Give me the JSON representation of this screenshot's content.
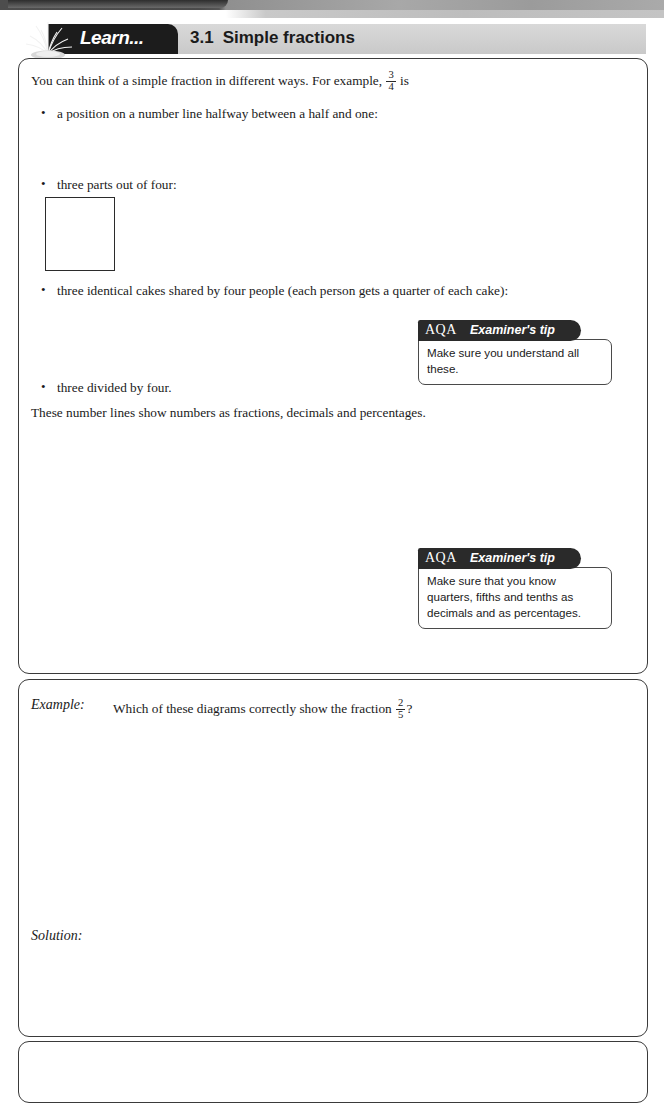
{
  "header": {
    "badge_label": "Learn...",
    "section_number": "3.1",
    "section_title": "Simple fractions",
    "plant_icon": "plant-icon"
  },
  "learn": {
    "intro": {
      "before": "You can think of a simple fraction in different ways. For example,",
      "fraction": {
        "numerator": "3",
        "denominator": "4"
      },
      "after": "is"
    },
    "bullets": [
      "a position on a number line halfway between a half and one:",
      "three parts out of four:",
      "three identical cakes shared by four people (each person gets a quarter of each cake):",
      "three divided by four."
    ],
    "numberline_top": {
      "labels": [
        "0",
        "1/4",
        "1/2",
        "3/4",
        "1"
      ],
      "fractions": [
        {
          "numerator": "",
          "denominator": "",
          "plain": "0"
        },
        {
          "numerator": "1",
          "denominator": "4",
          "plain": ""
        },
        {
          "numerator": "1",
          "denominator": "2",
          "plain": ""
        },
        {
          "numerator": "3",
          "denominator": "4",
          "plain": ""
        },
        {
          "numerator": "",
          "denominator": "",
          "plain": "1"
        }
      ]
    },
    "grid_three_quarters": {
      "rows": 2,
      "cols": 2,
      "shaded": [
        true,
        true,
        true,
        false
      ]
    },
    "cakes": [
      {
        "rows": 2,
        "cols": 2,
        "shaded": [
          true,
          false,
          false,
          false
        ]
      },
      {
        "rows": 2,
        "cols": 2,
        "shaded": [
          true,
          false,
          false,
          false
        ]
      },
      {
        "rows": 2,
        "cols": 2,
        "shaded": [
          true,
          false,
          false,
          false
        ]
      }
    ],
    "numberlines_intro": "These number lines show numbers as fractions, decimals and percentages.",
    "numberlines": [
      {
        "name": "quarters",
        "fractions": [
          "0",
          "1/4",
          "1/2",
          "3/4",
          "1"
        ],
        "fraction_parts": [
          {
            "plain": "0"
          },
          {
            "numerator": "1",
            "denominator": "4"
          },
          {
            "numerator": "1",
            "denominator": "2"
          },
          {
            "numerator": "3",
            "denominator": "4"
          },
          {
            "plain": "1"
          }
        ],
        "decimals": [
          "0",
          "0.25",
          "0.5",
          "0.75",
          "1"
        ],
        "percentages": [
          "0%",
          "25%",
          "50%",
          "75%",
          "100%"
        ]
      },
      {
        "name": "fifths",
        "fractions": [
          "0",
          "1/5",
          "2/5",
          "3/5",
          "4/5",
          "1"
        ],
        "fraction_parts": [
          {
            "plain": "0"
          },
          {
            "numerator": "1",
            "denominator": "5"
          },
          {
            "numerator": "2",
            "denominator": "5"
          },
          {
            "numerator": "3",
            "denominator": "5"
          },
          {
            "numerator": "4",
            "denominator": "5"
          },
          {
            "plain": "1"
          }
        ],
        "decimals": [
          "0",
          "0.2",
          "0.4",
          "0.6",
          "0.8",
          "1"
        ],
        "percentages": [
          "0%",
          "20%",
          "40%",
          "60%",
          "80%",
          "100%"
        ]
      },
      {
        "name": "tenths",
        "fractions": [
          "0",
          "1/10",
          "2/10",
          "3/10",
          "4/10",
          "5/10",
          "6/10",
          "7/10",
          "8/10",
          "9/10",
          "1"
        ],
        "fraction_parts": [
          {
            "plain": "0"
          },
          {
            "numerator": "1",
            "denominator": "10"
          },
          {
            "numerator": "2",
            "denominator": "10"
          },
          {
            "numerator": "3",
            "denominator": "10"
          },
          {
            "numerator": "4",
            "denominator": "10"
          },
          {
            "numerator": "5",
            "denominator": "10"
          },
          {
            "numerator": "6",
            "denominator": "10"
          },
          {
            "numerator": "7",
            "denominator": "10"
          },
          {
            "numerator": "8",
            "denominator": "10"
          },
          {
            "numerator": "9",
            "denominator": "10"
          },
          {
            "plain": "1"
          }
        ],
        "decimals": [
          "0",
          "0.1",
          "0.2",
          "0.3",
          "0.4",
          "0.5",
          "0.6",
          "0.7",
          "0.8",
          "0.9",
          "1"
        ],
        "percentages": [
          "0%",
          "10%",
          "20%",
          "30%",
          "40%",
          "50%",
          "60%",
          "70%",
          "80%",
          "90%",
          "100%"
        ]
      }
    ]
  },
  "tips": [
    {
      "brand": "AQA",
      "title": "Examiner's tip",
      "body": "Make sure you understand all these."
    },
    {
      "brand": "AQA",
      "title": "Examiner's tip",
      "body": "Make sure that you know quarters, fifths and tenths as decimals and as percentages."
    }
  ],
  "example": {
    "label": "Example:",
    "question_before": "Which of these diagrams correctly show the fraction",
    "question_fraction": {
      "numerator": "2",
      "denominator": "5"
    },
    "question_after": "?",
    "options": [
      {
        "letter": "a",
        "type": "bar",
        "segments": [
          {
            "width": 46,
            "shaded": false
          },
          {
            "width": 46,
            "shaded": false
          },
          {
            "width": 46,
            "shaded": false
          },
          {
            "width": 46,
            "shaded": true
          },
          {
            "width": 46,
            "shaded": true
          }
        ]
      },
      {
        "letter": "b",
        "type": "bar",
        "segments": [
          {
            "width": 47,
            "shaded": true
          },
          {
            "width": 47,
            "shaded": true
          },
          {
            "width": 31,
            "shaded": false
          },
          {
            "width": 31,
            "shaded": false
          },
          {
            "width": 31,
            "shaded": false
          }
        ]
      },
      {
        "letter": "c",
        "type": "bar",
        "segments": [
          {
            "width": 25,
            "shaded": true
          },
          {
            "width": 25,
            "shaded": true
          },
          {
            "width": 25,
            "shaded": false
          },
          {
            "width": 25,
            "shaded": false
          },
          {
            "width": 25,
            "shaded": false
          },
          {
            "width": 25,
            "shaded": false
          },
          {
            "width": 25,
            "shaded": false
          }
        ]
      },
      {
        "letter": "d",
        "type": "pentagon",
        "slices_total": 5,
        "slices_shaded": 2
      }
    ]
  },
  "solution": {
    "label": "Solution:",
    "items": [
      {
        "letter": "a",
        "text": "Correct: the bar is split into five equal pieces and two are shaded."
      },
      {
        "letter": "b",
        "text": "Incorrect: the bar is not split into equal pieces."
      },
      {
        "letter": "c",
        "text": "Incorrect: the bar is not split into five pieces."
      },
      {
        "letter": "d",
        "text": "Correct: the shape is split into five equal pieces and two are shaded."
      }
    ]
  },
  "colors": {
    "shade": "#9d9d9d",
    "stroke": "#2b2b2b",
    "badge_bg": "#1c1c1c",
    "header_bar": "#d0d0d0",
    "tip_tab": "#2a2a2a"
  }
}
